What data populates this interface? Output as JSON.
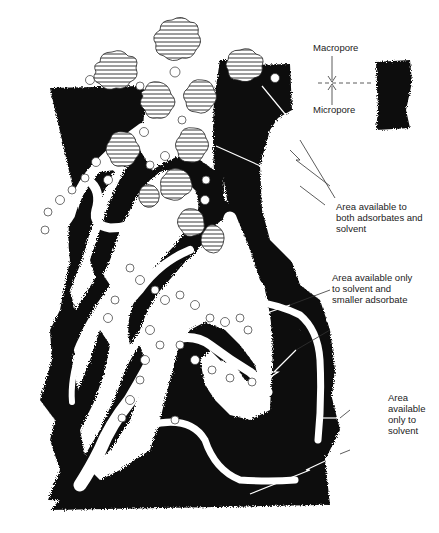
{
  "figure": {
    "type": "pore-structure-schematic",
    "labels": {
      "macropore": "Macropore",
      "micropore": "Micropore",
      "both": [
        "Area available to",
        "both adsorbates and",
        "solvent"
      ],
      "solvent_smaller": [
        "Area available only",
        "to solvent and",
        "smaller adsorbate"
      ],
      "solvent_only": [
        "Area",
        "available",
        "only to",
        "solvent"
      ]
    },
    "legend_elements": {
      "large_adsorbate": "hatched-cloud-shape",
      "small_adsorbate": "open-circle",
      "solid": "black-mass",
      "pore": "white-channel"
    },
    "colors": {
      "solid": "#0a0a0a",
      "pore": "#ffffff",
      "line": "#333333"
    }
  }
}
